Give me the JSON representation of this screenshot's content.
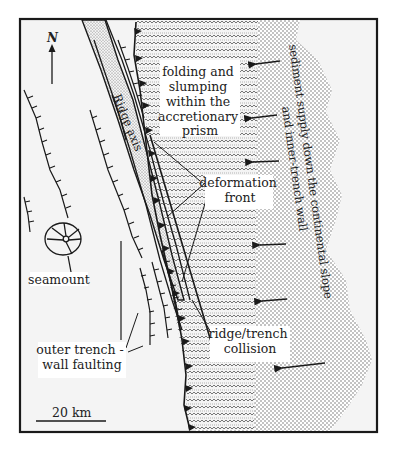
{
  "figure": {
    "frame": {
      "x": 20,
      "y": 19,
      "w": 357,
      "h": 413
    },
    "colors": {
      "ink": "#1a1a1a",
      "paper": "#ffffff",
      "ocean": "#f4f4f4",
      "stipple": "#777777",
      "zigzag": "#555555"
    }
  },
  "labels": {
    "north": "N",
    "ridge_axis": "Ridge axis",
    "prism_label": [
      "folding and",
      "slumping",
      "within the",
      "accretionary",
      "prism"
    ],
    "sediment_label": [
      "sediment supply down the continental slope",
      "and inner-trench wall"
    ],
    "deformation_front": [
      "deformation",
      "front"
    ],
    "seamount": "seamount",
    "outer_trench": [
      "outer trench -",
      "wall faulting"
    ],
    "collision": [
      "ridge/trench",
      "collision"
    ],
    "scale": "20 km"
  },
  "arrows": [
    {
      "x1": 280,
      "y1": 61,
      "x2": 256,
      "y2": 64
    },
    {
      "x1": 277,
      "y1": 115,
      "x2": 252,
      "y2": 118
    },
    {
      "x1": 279,
      "y1": 161,
      "x2": 253,
      "y2": 162
    },
    {
      "x1": 286,
      "y1": 244,
      "x2": 260,
      "y2": 245
    },
    {
      "x1": 287,
      "y1": 299,
      "x2": 262,
      "y2": 301
    },
    {
      "x1": 325,
      "y1": 363,
      "x2": 282,
      "y2": 368
    }
  ]
}
